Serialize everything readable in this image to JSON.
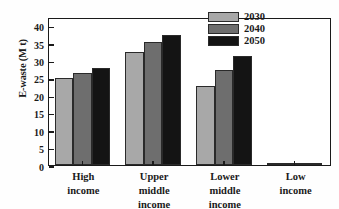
{
  "chart_data": {
    "type": "bar",
    "title": "",
    "xlabel": "",
    "ylabel": "E-waste (M t)",
    "categories": [
      "High\nincome",
      "Upper\nmiddle\nincome",
      "Lower\nmiddle\nincome",
      "Low\nincome"
    ],
    "series": [
      {
        "name": "2030",
        "color": "#a8a8a8",
        "values": [
          25.0,
          32.5,
          22.8,
          0.45
        ]
      },
      {
        "name": "2040",
        "color": "#6e6e6e",
        "values": [
          26.5,
          35.4,
          27.4,
          0.5
        ]
      },
      {
        "name": "2050",
        "color": "#141414",
        "values": [
          27.8,
          37.3,
          31.2,
          0.55
        ]
      }
    ],
    "ylim": [
      0,
      42.5
    ],
    "yticks": [
      0,
      5,
      10,
      15,
      20,
      25,
      30,
      35,
      40
    ],
    "ytick_labels": [
      "0",
      "5",
      "10",
      "15",
      "20",
      "25",
      "30",
      "35",
      "40"
    ],
    "grid": false,
    "legend_position": "top-right",
    "legend_entries": [
      "2030",
      "2040",
      "2050"
    ]
  }
}
